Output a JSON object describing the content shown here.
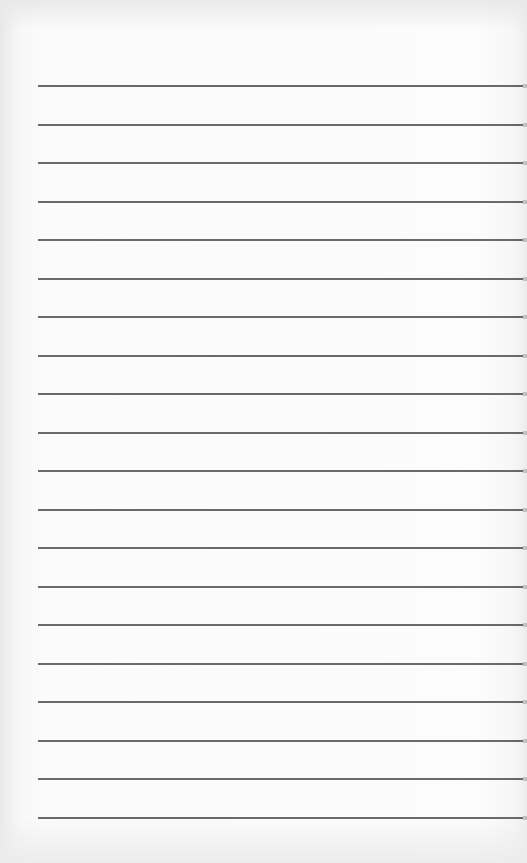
{
  "document": {
    "type": "lined-paper",
    "background_color": "#fbfbfb",
    "line_color": "#5a5a5a",
    "line_count": 20,
    "line_left": 38,
    "line_right": 527,
    "first_line_y": 86,
    "line_spacing": 38.5,
    "text_content": ""
  }
}
